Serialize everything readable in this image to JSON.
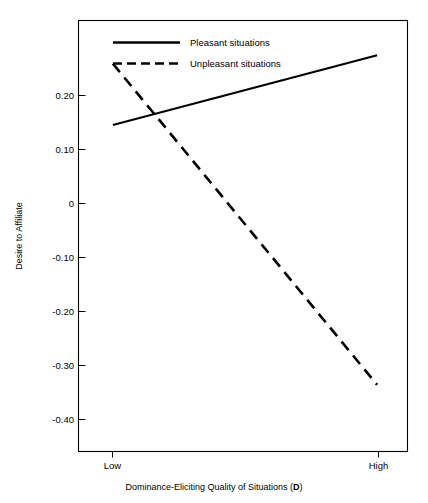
{
  "chart_data": {
    "type": "line",
    "title": "",
    "subtitle": "",
    "xlabel": "Dominance-Eliciting Quality of Situations (D)",
    "xlabel_plain": "Dominance-Eliciting Quality of Situations (",
    "xlabel_bold": "D",
    "xlabel_tail": ")",
    "ylabel": "Desire to Affiliate",
    "categories": [
      "Low",
      "High"
    ],
    "x": [
      0,
      1
    ],
    "xlim": [
      -0.13,
      1.115
    ],
    "ylim": [
      -0.475,
      0.255
    ],
    "ytick_values": [
      0.2,
      0.1,
      0,
      -0.1,
      -0.2,
      -0.3,
      -0.4
    ],
    "ytick_labels": [
      "0.20",
      "0.10",
      "0",
      "-0.10",
      "-0.20",
      "-0.30",
      "-0.40"
    ],
    "grid": false,
    "legend_position": "top-center",
    "series": [
      {
        "name": "Pleasant situations",
        "style": "solid",
        "color": "#000000",
        "values": [
          0.078,
          0.196
        ]
      },
      {
        "name": "Unpleasant situations",
        "style": "dashed",
        "color": "#000000",
        "values": [
          0.182,
          -0.362
        ]
      }
    ]
  },
  "legend": {
    "items": [
      {
        "label": "Pleasant situations",
        "style": "solid"
      },
      {
        "label": "Unpleasant situations",
        "style": "dashed"
      }
    ]
  },
  "axes": {
    "y_tick_labels": [
      "0.20",
      "0.10",
      "0",
      "-0.10",
      "-0.20",
      "-0.30",
      "-0.40"
    ],
    "x_tick_labels": [
      "Low",
      "High"
    ],
    "y_axis_title": "Desire to Affiliate",
    "x_axis_title_plain": "Dominance-Eliciting Quality of Situations (",
    "x_axis_title_bold": "D",
    "x_axis_title_tail": ")"
  }
}
